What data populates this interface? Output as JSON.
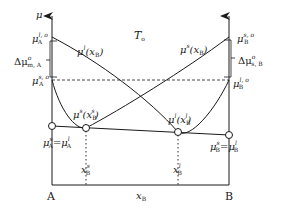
{
  "diagram": {
    "temperature_label": "T",
    "temperature_sub": "o",
    "y_axis_label": "μ",
    "x_axis_label": "x",
    "x_axis_sub": "B",
    "left_end_label": "A",
    "right_end_label": "B",
    "colors": {
      "line": "#1a1a1a",
      "background": "#ffffff"
    }
  },
  "left_axis": {
    "mu_A_l_o": {
      "base": "μ",
      "sup": "l, o",
      "sub": "A"
    },
    "mu_A_s_o": {
      "base": "μ",
      "sup": "s, o",
      "sub": "A"
    },
    "delta": {
      "base": "Δμ",
      "sup": "o",
      "sub": "m, A"
    },
    "equality": {
      "left_base": "μ",
      "left_sup": "s",
      "left_sub": "A",
      "eq": "=",
      "right_base": "μ",
      "right_sup": "l",
      "right_sub": "A"
    }
  },
  "right_axis": {
    "mu_B_s_o": {
      "base": "μ",
      "sup": "s, o",
      "sub": "B"
    },
    "mu_B_l_o": {
      "base": "μ",
      "sup": "l, o",
      "sub": "B"
    },
    "delta": {
      "base": "Δμ",
      "sup": "o",
      "sub": "s, B"
    },
    "equality": {
      "left_base": "μ",
      "left_sup": "s",
      "left_sub": "B",
      "eq": "=",
      "right_base": "μ",
      "right_sup": "l",
      "right_sub": "B"
    }
  },
  "curves": {
    "liquid_line": {
      "label_base": "μ",
      "label_sup": "l",
      "label_arg": "(x",
      "label_arg_sub": "B",
      "label_close": ")"
    },
    "solid_line": {
      "label_base": "μ",
      "label_sup": "s",
      "label_arg": "(x",
      "label_arg_sub": "B",
      "label_close": ")"
    },
    "solid_min": {
      "label_base": "μ",
      "label_sup": "s",
      "label_arg": "(x",
      "label_arg_sub": "B",
      "label_arg_sup": "s",
      "label_close": ")"
    },
    "liquid_min": {
      "label_base": "μ",
      "label_sup": "l",
      "label_arg": "(x",
      "label_arg_sub": "B",
      "label_arg_sup": "l",
      "label_close": ")"
    }
  },
  "compositions": {
    "x_s": {
      "base": "x",
      "sup": "s",
      "sub": "B"
    },
    "x_l": {
      "base": "x",
      "sup": "l",
      "sub": "B"
    }
  }
}
